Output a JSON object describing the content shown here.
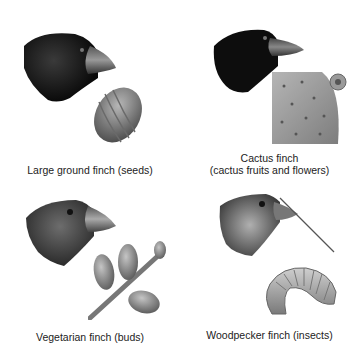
{
  "figure": {
    "panels": [
      {
        "name": "large-ground-finch",
        "label": "Large ground finch (seeds)",
        "food_icon": "seed-icon"
      },
      {
        "name": "cactus-finch",
        "label_line1": "Cactus finch",
        "label_line2": "(cactus fruits and flowers)",
        "food_icon": "cactus-pad-icon"
      },
      {
        "name": "vegetarian-finch",
        "label": "Vegetarian finch (buds)",
        "food_icon": "buds-icon"
      },
      {
        "name": "woodpecker-finch",
        "label": "Woodpecker finch (insects)",
        "food_icon": "larva-icon"
      }
    ]
  }
}
